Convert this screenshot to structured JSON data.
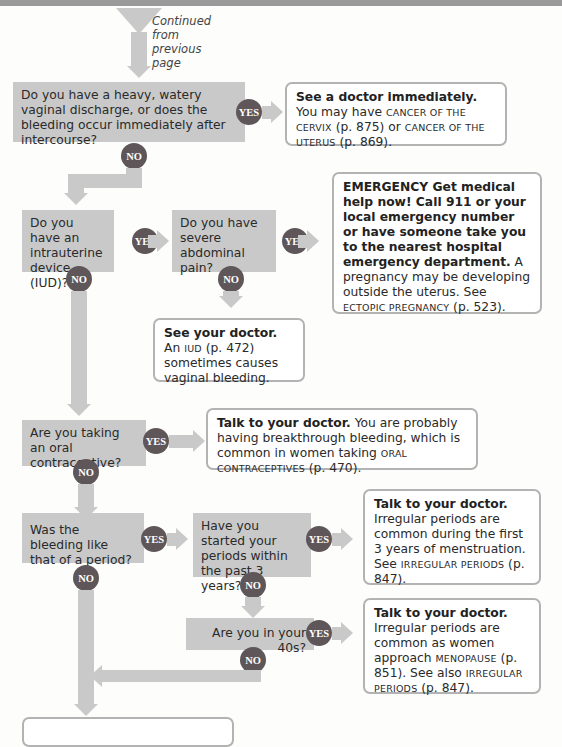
{
  "header": {
    "continued_note": "Continued from previous page"
  },
  "labels": {
    "yes": "YES",
    "no": "NO"
  },
  "questions": {
    "q1": "Do you have a heavy, watery vaginal discharge, or does the bleeding occur immediately after intercourse?",
    "q2": "Do you have an intrauterine device (IUD)?",
    "q3": "Do you have severe abdominal pain?",
    "q4": "Are you taking an oral contraceptive?",
    "q5": "Was the bleeding like that of a period?",
    "q6": "Have you started your periods within the past 3 years?",
    "q7": "Are you in your 40s?"
  },
  "results": {
    "r1": {
      "bold": "See a doctor immediately.",
      "text1": " You may have ",
      "sc1": "CANCER OF THE CERVIX",
      "text2": " (p. 875) or ",
      "sc2": "CANCER OF THE UTERUS",
      "text3": " (p. 869)."
    },
    "r2": {
      "bold": "EMERGENCY  Get medical help now! Call 911 or your local emergency number or have someone take you to the nearest hospital emergency department.",
      "text1": " A pregnancy may be developing outside the uterus. See ",
      "sc1": "ECTOPIC PREGNANCY",
      "text2": " (p. 523)."
    },
    "r3": {
      "bold": "See your doctor.",
      "text1": " An ",
      "sc1": "IUD",
      "text2": " (p. 472) sometimes causes vaginal bleeding."
    },
    "r4": {
      "bold": "Talk to your doctor.",
      "text1": " You are probably having breakthrough bleeding, which is common in women taking ",
      "sc1": "ORAL CONTRACEPTIVES",
      "text2": " (p. 470)."
    },
    "r5": {
      "bold": "Talk to your doctor.",
      "text1": " Irregular periods are common during the first 3 years of menstruation. See ",
      "sc1": "IRREGULAR PERIODS",
      "text2": " (p. 847)."
    },
    "r6": {
      "bold": "Talk to your doctor.",
      "text1": " Irregular periods are common as women approach ",
      "sc1": "MENOPAUSE",
      "text2": " (p. 851). See also ",
      "sc2": "IRREGULAR PERIODS",
      "text3": " (p. 847)."
    }
  },
  "colors": {
    "question_bg": "#c9c9c9",
    "badge": "#5e5658",
    "result_border": "#b3b3b3"
  }
}
